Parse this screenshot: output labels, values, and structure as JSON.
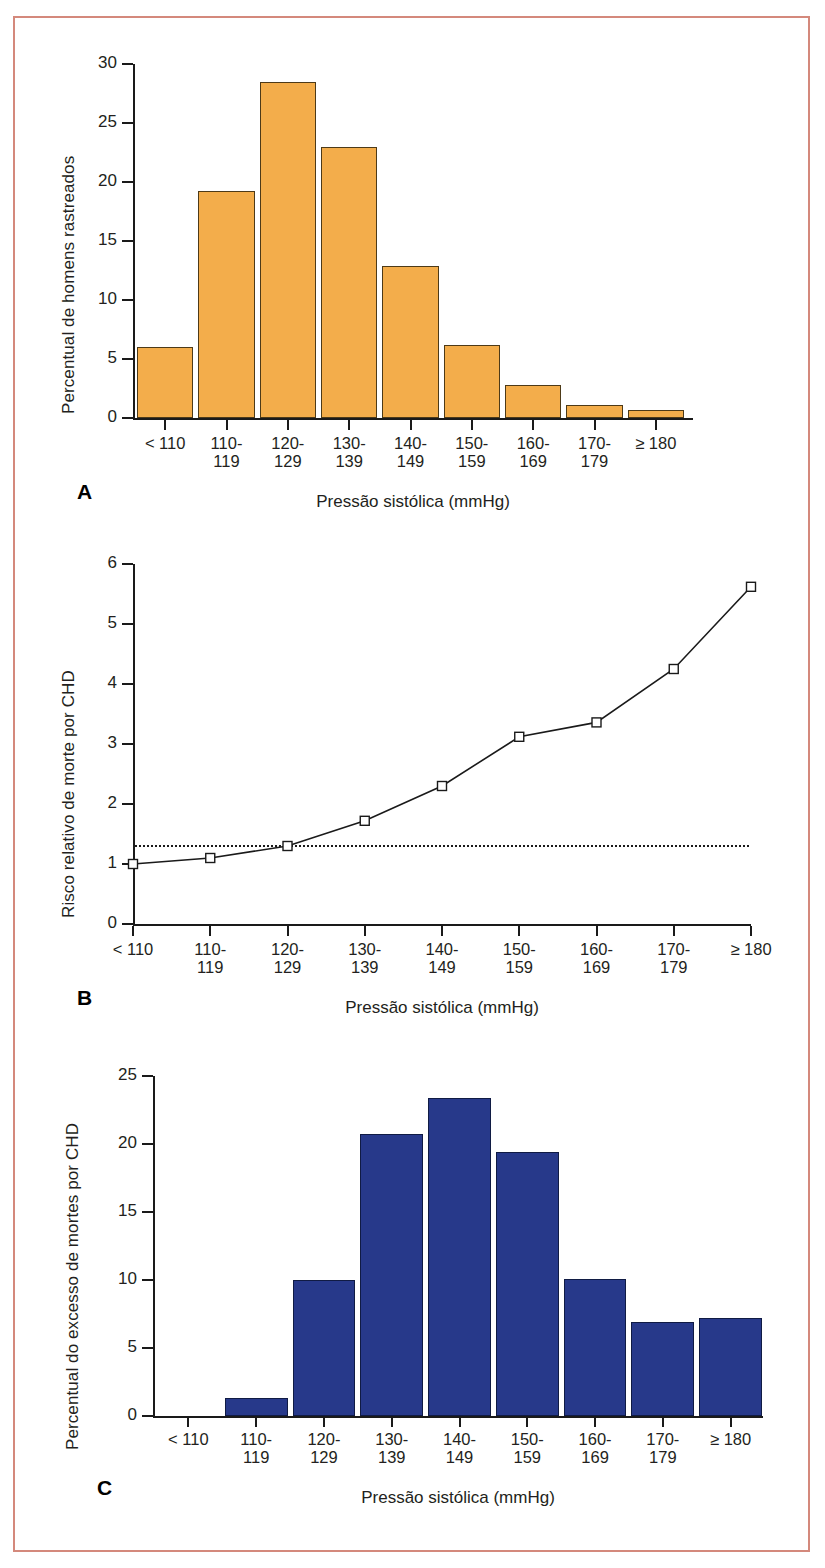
{
  "figure": {
    "border_color": "#d4897c",
    "background": "#ffffff"
  },
  "panels": [
    {
      "letter": "A",
      "ylabel": "Percentual de homens rastreados",
      "xlabel": "Pressão sistólica (mmHg)",
      "ytick_labels": [
        "30",
        "25",
        "20",
        "15",
        "10",
        "5",
        "0"
      ],
      "categories": [
        "< 110",
        "110-\n119",
        "120-\n129",
        "130-\n139",
        "140-\n149",
        "150-\n159",
        "160-\n169",
        "170-\n179",
        "≥ 180"
      ],
      "bar_color": "#f3ad4b"
    },
    {
      "letter": "B",
      "ylabel": "Risco relativo de morte por CHD",
      "xlabel": "Pressão sistólica (mmHg)",
      "ytick_labels": [
        "6",
        "5",
        "4",
        "3",
        "2",
        "1",
        "0"
      ],
      "categories": [
        "< 110",
        "110-\n119",
        "120-\n129",
        "130-\n139",
        "140-\n149",
        "150-\n159",
        "160-\n169",
        "170-\n179",
        "≥ 180"
      ],
      "marker": "open-square",
      "reference_line": "dotted"
    },
    {
      "letter": "C",
      "ylabel": "Percentual do excesso de mortes por CHD",
      "xlabel": "Pressão sistólica (mmHg)",
      "ytick_labels": [
        "25",
        "20",
        "15",
        "10",
        "5",
        "0"
      ],
      "categories": [
        "< 110",
        "110-\n119",
        "120-\n129",
        "130-\n139",
        "140-\n149",
        "150-\n159",
        "160-\n169",
        "170-\n179",
        "≥ 180"
      ],
      "bar_color": "#27398a"
    }
  ],
  "chart_data": [
    {
      "id": "A",
      "type": "bar",
      "title": "",
      "xlabel": "Pressão sistólica (mmHg)",
      "ylabel": "Percentual de homens rastreados",
      "categories": [
        "< 110",
        "110-119",
        "120-129",
        "130-139",
        "140-149",
        "150-159",
        "160-169",
        "170-179",
        "≥ 180"
      ],
      "values": [
        6.0,
        19.2,
        28.5,
        23.0,
        12.9,
        6.2,
        2.8,
        1.1,
        0.7
      ],
      "ylim": [
        0,
        30
      ],
      "yticks": [
        0,
        5,
        10,
        15,
        20,
        25,
        30
      ],
      "grid": false,
      "legend": "none",
      "bar_color": "#f3ad4b",
      "bar_border": "#4d3a18"
    },
    {
      "id": "B",
      "type": "line",
      "title": "",
      "xlabel": "Pressão sistólica (mmHg)",
      "ylabel": "Risco relativo de morte por CHD",
      "categories": [
        "< 110",
        "110-119",
        "120-129",
        "130-139",
        "140-149",
        "150-159",
        "160-169",
        "170-179",
        "≥ 180"
      ],
      "values": [
        1.0,
        1.1,
        1.3,
        1.72,
        2.3,
        3.12,
        3.36,
        4.25,
        5.62
      ],
      "ylim": [
        0,
        6
      ],
      "yticks": [
        0,
        1,
        2,
        3,
        4,
        5,
        6
      ],
      "reference_line_y": 1.3,
      "reference_line_style": "dotted",
      "marker": "open-square",
      "line_color": "#1a1a1a",
      "grid": false,
      "legend": "none"
    },
    {
      "id": "C",
      "type": "bar",
      "title": "",
      "xlabel": "Pressão sistólica (mmHg)",
      "ylabel": "Percentual do excesso de mortes por CHD",
      "categories": [
        "< 110",
        "110-119",
        "120-129",
        "130-139",
        "140-149",
        "150-159",
        "160-169",
        "170-179",
        "≥ 180"
      ],
      "values": [
        0.0,
        1.3,
        10.0,
        20.7,
        23.4,
        19.4,
        10.1,
        6.9,
        7.2
      ],
      "ylim": [
        0,
        25
      ],
      "yticks": [
        0,
        5,
        10,
        15,
        20,
        25
      ],
      "grid": false,
      "legend": "none",
      "bar_color": "#27398a",
      "bar_border": "#101b44"
    }
  ]
}
